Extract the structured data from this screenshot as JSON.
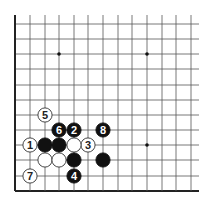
{
  "diagram": {
    "type": "go-board-fragment",
    "colors": {
      "background": "#ffffff",
      "line": "#555555",
      "edge": "#222222",
      "black": "#111111",
      "white": "#ffffff",
      "star": "#111111"
    },
    "grid": {
      "x": [
        15,
        30,
        45,
        59,
        74,
        88,
        103,
        118,
        132,
        147,
        162,
        176,
        191
      ],
      "y": [
        24,
        39,
        54,
        69,
        85,
        100,
        115,
        130,
        145,
        160,
        176,
        191
      ],
      "line_right": 199,
      "line_top": 15,
      "left_edge": true,
      "bottom_edge": true
    },
    "star_points": [
      {
        "col": 3,
        "row": 2
      },
      {
        "col": 9,
        "row": 2
      },
      {
        "col": 9,
        "row": 8
      }
    ],
    "stones": [
      {
        "color": "white",
        "col": 1,
        "row": 8,
        "label": "1"
      },
      {
        "color": "black",
        "col": 4,
        "row": 7,
        "label": "2"
      },
      {
        "color": "white",
        "col": 5,
        "row": 8,
        "label": "3"
      },
      {
        "color": "black",
        "col": 4,
        "row": 10,
        "label": "4"
      },
      {
        "color": "white",
        "col": 2,
        "row": 6,
        "label": "5"
      },
      {
        "color": "black",
        "col": 3,
        "row": 7,
        "label": "6"
      },
      {
        "color": "white",
        "col": 1,
        "row": 10,
        "label": "7"
      },
      {
        "color": "black",
        "col": 6,
        "row": 7,
        "label": "8"
      },
      {
        "color": "black",
        "col": 2,
        "row": 8,
        "label": ""
      },
      {
        "color": "black",
        "col": 3,
        "row": 8,
        "label": ""
      },
      {
        "color": "white",
        "col": 4,
        "row": 8,
        "label": ""
      },
      {
        "color": "white",
        "col": 2,
        "row": 9,
        "label": ""
      },
      {
        "color": "white",
        "col": 3,
        "row": 9,
        "label": ""
      },
      {
        "color": "black",
        "col": 4,
        "row": 9,
        "label": ""
      },
      {
        "color": "black",
        "col": 6,
        "row": 9,
        "label": ""
      }
    ]
  }
}
